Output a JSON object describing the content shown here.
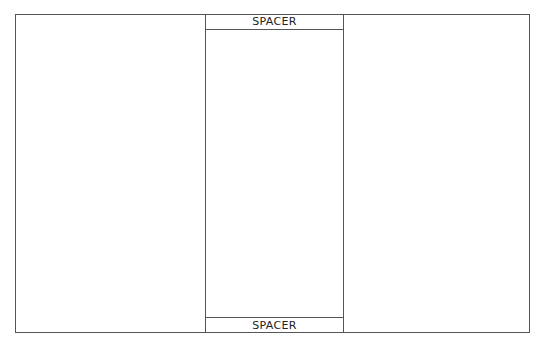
{
  "layout": {
    "center_column": {
      "top_spacer": {
        "label": "SPACER"
      },
      "bottom_spacer": {
        "label": "SPACER"
      }
    }
  },
  "colors": {
    "border": "#555555",
    "background": "#ffffff",
    "text": "#222222"
  }
}
